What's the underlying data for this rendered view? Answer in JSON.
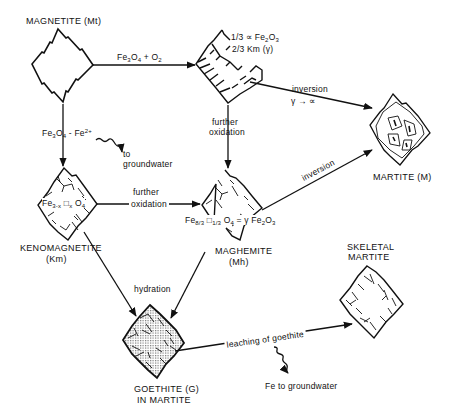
{
  "nodes": {
    "magnetite": {
      "label": "MAGNETITE (Mt)"
    },
    "oxidized_mix": {
      "line1": "1/3 ∝ Fe2O3",
      "line1_frac": "1/3",
      "line1_alpha": "∝",
      "line1_formula": "Fe2O3",
      "line2_frac": "2/3",
      "line2_rest": "Km (γ)"
    },
    "martite": {
      "label": "MARTITE (M)"
    },
    "kenomagnetite": {
      "label_line1": "KENOMAGNETITE",
      "label_line2": "(Km)",
      "formula": "Fe3-x □x O4"
    },
    "maghemite": {
      "label_line1": "MAGHEMITE",
      "label_line2": "(Mh)",
      "formula": "Fe8/3 □1/3 O4 = γ Fe2O3"
    },
    "goethite": {
      "label_line1": "GOETHITE (G)",
      "label_line2": "IN MARTITE"
    },
    "skeletal_martite": {
      "label_line1": "SKELETAL",
      "label_line2": "MARTITE"
    }
  },
  "edges": {
    "mt_to_mix": {
      "label": "Fe3O4 + O2"
    },
    "mt_to_km": {
      "label": "Fe3O4 - Fe2+"
    },
    "fe2_groundwater": {
      "line1": "to",
      "line2": "groundwater"
    },
    "mix_to_martite": {
      "line1": "inversion",
      "line2": "γ → ∝"
    },
    "mix_to_mh": {
      "line1": "further",
      "line2": "oxidation"
    },
    "km_to_mh": {
      "line1": "further",
      "line2": "oxidation"
    },
    "mh_to_martite": {
      "label": "inversion"
    },
    "hydration": {
      "label": "hydration"
    },
    "leaching": {
      "label": "leaching of goethite"
    },
    "fe_groundwater": {
      "label": "Fe to groundwater"
    }
  },
  "colors": {
    "ink": "#111111",
    "background": "#ffffff",
    "stipple": "#bdbdbd"
  }
}
